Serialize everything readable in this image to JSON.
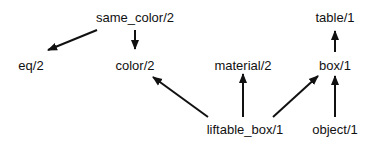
{
  "diagram": {
    "type": "dependency-graph",
    "colors": {
      "background": "#ffffff",
      "ink": "#111111"
    },
    "nodes": [
      {
        "id": "same_color",
        "label": "same_color/2",
        "x": 135,
        "y": 22
      },
      {
        "id": "eq",
        "label": "eq/2",
        "x": 31,
        "y": 70
      },
      {
        "id": "color",
        "label": "color/2",
        "x": 135,
        "y": 70
      },
      {
        "id": "material",
        "label": "material/2",
        "x": 243,
        "y": 70
      },
      {
        "id": "table",
        "label": "table/1",
        "x": 335,
        "y": 22
      },
      {
        "id": "box",
        "label": "box/1",
        "x": 335,
        "y": 70
      },
      {
        "id": "liftable_box",
        "label": "liftable_box/1",
        "x": 245,
        "y": 134
      },
      {
        "id": "object",
        "label": "object/1",
        "x": 335,
        "y": 134
      }
    ],
    "edges": [
      {
        "from": "same_color",
        "to": "eq",
        "x1": 97,
        "y1": 30,
        "x2": 48,
        "y2": 50
      },
      {
        "from": "same_color",
        "to": "color",
        "x1": 135,
        "y1": 30,
        "x2": 135,
        "y2": 49
      },
      {
        "from": "liftable_box",
        "to": "color",
        "x1": 208,
        "y1": 117,
        "x2": 153,
        "y2": 77
      },
      {
        "from": "liftable_box",
        "to": "material",
        "x1": 243,
        "y1": 117,
        "x2": 243,
        "y2": 74
      },
      {
        "from": "liftable_box",
        "to": "box",
        "x1": 273,
        "y1": 117,
        "x2": 318,
        "y2": 76
      },
      {
        "from": "object",
        "to": "box",
        "x1": 335,
        "y1": 117,
        "x2": 335,
        "y2": 76
      },
      {
        "from": "box",
        "to": "table",
        "x1": 335,
        "y1": 52,
        "x2": 335,
        "y2": 31
      }
    ]
  }
}
